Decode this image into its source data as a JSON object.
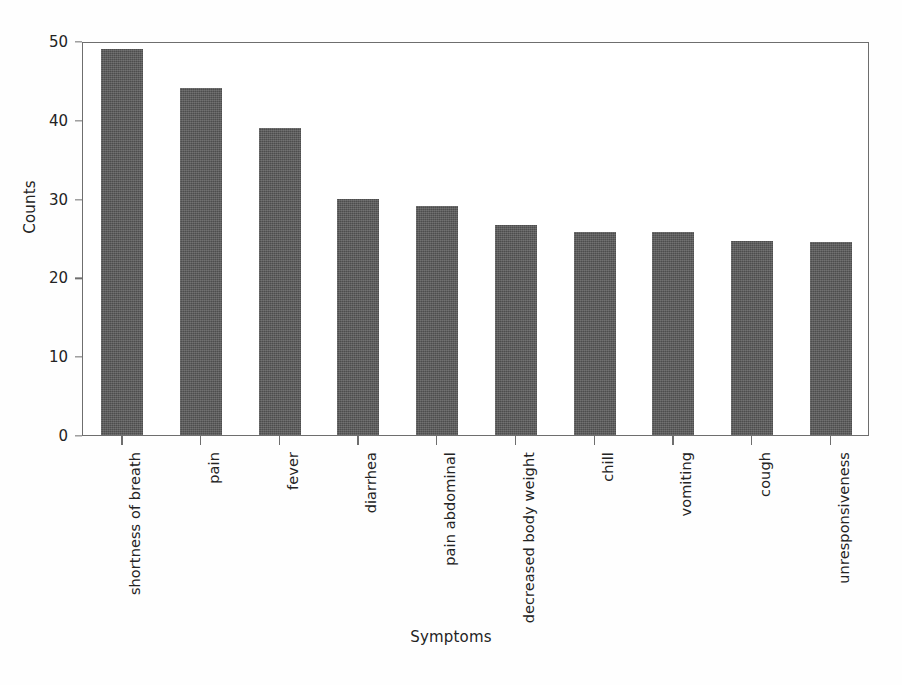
{
  "chart_data": {
    "type": "bar",
    "title": "",
    "xlabel": "Symptoms",
    "ylabel": "Counts",
    "categories": [
      "shortness of breath",
      "pain",
      "fever",
      "diarrhea",
      "pain abdominal",
      "decreased body weight",
      "chill",
      "vomiting",
      "cough",
      "unresponsiveness"
    ],
    "values": [
      49,
      44,
      39,
      30,
      29,
      26.7,
      25.7,
      25.7,
      24.6,
      24.5
    ],
    "ylim": [
      0,
      50
    ],
    "yticks": [
      0,
      10,
      20,
      30,
      40,
      50
    ],
    "ytick_labels": [
      "0",
      "10",
      "20",
      "30",
      "40",
      "50"
    ],
    "grid": false,
    "legend": false,
    "bar_color": "#585858",
    "axis_color": "#6e6e6e",
    "background": "#ffffff"
  }
}
